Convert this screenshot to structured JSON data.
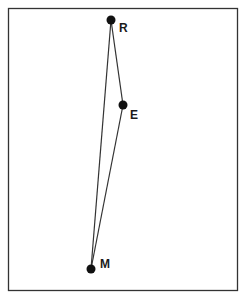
{
  "diagram": {
    "frame": {
      "x": 8,
      "y": 8,
      "width": 230,
      "height": 283,
      "stroke": "#333333"
    },
    "points": [
      {
        "id": "R",
        "label": "R",
        "x": 111,
        "y": 20,
        "label_dx": 8,
        "label_dy": 12
      },
      {
        "id": "E",
        "label": "E",
        "x": 123,
        "y": 105,
        "label_dx": 7,
        "label_dy": 14
      },
      {
        "id": "M",
        "label": "M",
        "x": 91,
        "y": 269,
        "label_dx": 9,
        "label_dy": -1
      }
    ],
    "edges": [
      {
        "from": "R",
        "to": "E"
      },
      {
        "from": "E",
        "to": "M"
      },
      {
        "from": "M",
        "to": "R"
      }
    ],
    "point_color": "#111111",
    "line_color": "#333333"
  }
}
